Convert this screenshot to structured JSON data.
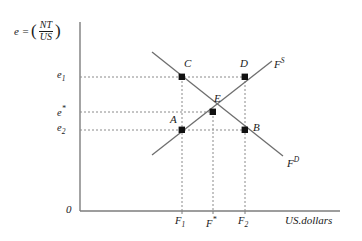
{
  "figure": {
    "type": "supply-demand-diagram",
    "y_axis": {
      "label_prefix": "e =",
      "fraction_numerator": "NT",
      "fraction_denominator": "US",
      "ticks": [
        {
          "id": "e1",
          "base": "e",
          "sub": "1",
          "value_y": 77
        },
        {
          "id": "estar",
          "base": "e",
          "sup": "*",
          "value_y": 112
        },
        {
          "id": "e2",
          "base": "e",
          "sub": "2",
          "value_y": 130
        }
      ]
    },
    "x_axis": {
      "unit_label": "US.dollars",
      "ticks": [
        {
          "id": "F1",
          "base": "F",
          "sub": "1",
          "value_x": 182
        },
        {
          "id": "Fstar",
          "base": "F",
          "sup": "*",
          "value_x": 213
        },
        {
          "id": "F2",
          "base": "F",
          "sub": "2",
          "value_x": 245
        }
      ]
    },
    "origin_label": "0",
    "curves": [
      {
        "id": "supply",
        "base": "F",
        "sup": "S",
        "label": "F",
        "superscript": "S"
      },
      {
        "id": "demand",
        "base": "F",
        "sup": "D",
        "label": "F",
        "superscript": "D"
      }
    ],
    "points": [
      {
        "id": "A",
        "label": "A",
        "x": 182,
        "y": 130
      },
      {
        "id": "B",
        "label": "B",
        "x": 245,
        "y": 130
      },
      {
        "id": "C",
        "label": "C",
        "x": 182,
        "y": 77
      },
      {
        "id": "D",
        "label": "D",
        "x": 245,
        "y": 77
      },
      {
        "id": "E",
        "label": "E",
        "x": 213,
        "y": 112
      }
    ]
  }
}
